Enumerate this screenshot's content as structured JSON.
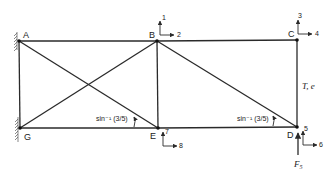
{
  "diagram": {
    "type": "plane truss",
    "nodes": [
      {
        "id": "A",
        "label": "A",
        "x": 19,
        "y": 41,
        "support": "fixed-wall"
      },
      {
        "id": "B",
        "label": "B",
        "x": 157,
        "y": 41
      },
      {
        "id": "C",
        "label": "C",
        "x": 297,
        "y": 41
      },
      {
        "id": "G",
        "label": "G",
        "x": 20,
        "y": 128,
        "support": "fixed-wall"
      },
      {
        "id": "E",
        "label": "E",
        "x": 158,
        "y": 128
      },
      {
        "id": "D",
        "label": "D",
        "x": 297,
        "y": 128
      }
    ],
    "members": [
      {
        "from": "A",
        "to": "B"
      },
      {
        "from": "B",
        "to": "C"
      },
      {
        "from": "G",
        "to": "E"
      },
      {
        "from": "E",
        "to": "D"
      },
      {
        "from": "A",
        "to": "G"
      },
      {
        "from": "B",
        "to": "E"
      },
      {
        "from": "C",
        "to": "D"
      },
      {
        "from": "A",
        "to": "E"
      },
      {
        "from": "G",
        "to": "B"
      },
      {
        "from": "B",
        "to": "D"
      }
    ],
    "dofs": [
      {
        "node": "B",
        "vertical": "1",
        "horizontal": "2"
      },
      {
        "node": "C",
        "vertical": "3",
        "horizontal": "4"
      },
      {
        "node": "D",
        "vertical": "5",
        "horizontal": "6"
      },
      {
        "node": "E",
        "vertical": "7",
        "horizontal": "8"
      }
    ],
    "angle_labels": [
      {
        "at": "E",
        "text": "sin⁻¹ (3/5)"
      },
      {
        "at": "D",
        "text": "sin⁻¹ (3/5)"
      }
    ],
    "member_label": {
      "member": "C-D",
      "text": "T, e"
    },
    "load": {
      "node": "D",
      "label": "F",
      "subscript": "5",
      "direction": "up"
    }
  }
}
